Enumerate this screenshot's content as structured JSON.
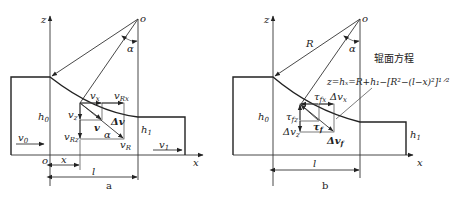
{
  "panel_a": {
    "caption": "a",
    "axis_z": "z",
    "axis_x": "x",
    "origin_top": "o",
    "origin_bottom": "o",
    "angle": "α",
    "h0": "h",
    "h0_sub": "0",
    "h1": "h",
    "h1_sub": "1",
    "v0": "v",
    "v0_sub": "0",
    "v1": "v",
    "v1_sub": "1",
    "vx": "v",
    "vx_sub": "x",
    "vRx": "v",
    "vRx_sub": "Rx",
    "vz": "v",
    "vz_sub": "z",
    "vRz": "v",
    "vRz_sub": "Rz",
    "v": "v",
    "dv": "Δv",
    "vR": "v",
    "vR_sub": "R",
    "dim_x": "x",
    "dim_l": "l"
  },
  "panel_b": {
    "caption": "b",
    "axis_z": "z",
    "axis_x": "x",
    "origin_top": "o",
    "radius": "R",
    "angle": "α",
    "h0": "h",
    "h0_sub": "0",
    "h1": "h",
    "h1_sub": "1",
    "title_cn": "辊面方程",
    "equation": "z=hₓ=R+h₁−[R²−(l−x)²]¹ᐟ²",
    "tfx": "τ",
    "tfx_sub": "fx",
    "dvx": "Δv",
    "dvx_sub": "x",
    "tfz": "τ",
    "tfz_sub": "fz",
    "dvz": "Δv",
    "dvz_sub": "z",
    "tf": "τ",
    "tf_sub": "f",
    "dvf": "Δv",
    "dvf_sub": "f",
    "dim_l": "l"
  }
}
